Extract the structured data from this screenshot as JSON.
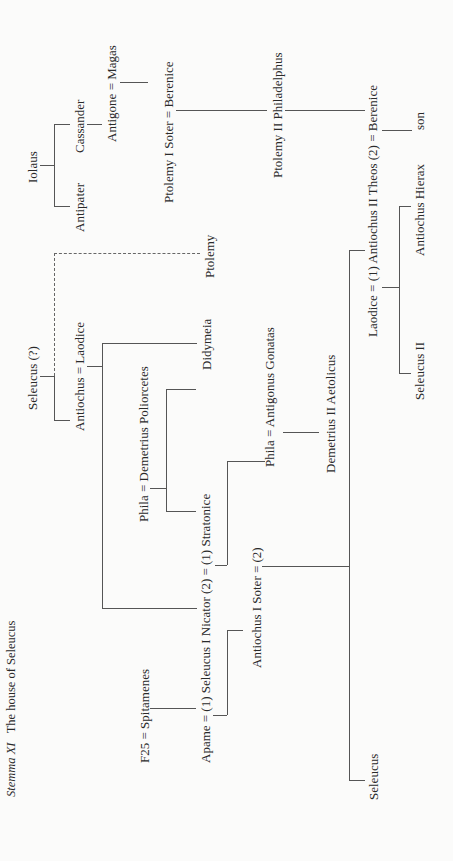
{
  "title": {
    "label": "Stemma XI",
    "text": "The house of Seleucus"
  },
  "nodes": {
    "iolaus": "Iolaus",
    "antipater": "Antipater",
    "cassander": "Cassander",
    "antigone_magas": "Antigone = Magas",
    "ptolemy1_berenice": "Ptolemy I Soter = Berenice",
    "ptolemy2": "Ptolemy II Philadelphus",
    "laodice_antiochus2_berenice": "Laodice = (1) Antiochus II Theos (2) = Berenice",
    "son": "son",
    "antiochus_hierax": "Antiochus Hierax",
    "seleucus2": "Seleucus II",
    "seleucus_q": "Seleucus (?)",
    "antiochus_laodice": "Antiochus = Laodice",
    "phila_demetrius": "Phila = Demetrius Poliorcetes",
    "didymeia": "Didymeia",
    "ptolemy": "Ptolemy",
    "phila_antigonus": "Phila = Antigonus Gonatas",
    "demetrius2": "Demetrius II Aetolicus",
    "f25_spitamenes": "F25 = Spitamenes",
    "apame_seleucus1_stratonice": "Apame = (1) Seleucus I Nicator (2) = (1) Stratonice",
    "antiochus1": "Antiochus I Soter = (2)",
    "seleucus": "Seleucus"
  }
}
